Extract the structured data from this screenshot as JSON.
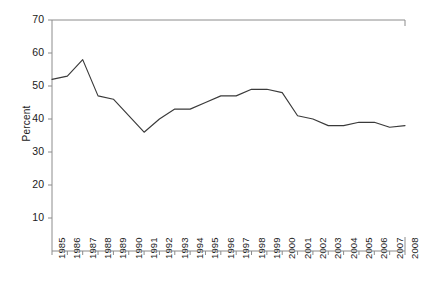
{
  "chart_data": {
    "type": "line",
    "title": "",
    "xlabel": "",
    "ylabel": "Percent",
    "ylim": [
      0,
      70
    ],
    "yticks": [
      0,
      10,
      20,
      30,
      40,
      50,
      60,
      70
    ],
    "ytick_labels": [
      "0",
      "10",
      "20",
      "30",
      "40",
      "50",
      "60",
      "70"
    ],
    "grid": false,
    "legend": "none",
    "categories": [
      "1985",
      "1986",
      "1987",
      "1988",
      "1989",
      "1990",
      "1991",
      "1992",
      "1993",
      "1994",
      "1995",
      "1996",
      "1997",
      "1998",
      "1999",
      "2000",
      "2001",
      "2002",
      "2003",
      "2004",
      "2005",
      "2006",
      "2007",
      "2008"
    ],
    "series": [
      {
        "name": "Percent",
        "values": [
          52,
          53,
          58,
          47,
          46,
          41,
          36,
          40,
          43,
          43,
          45,
          47,
          47,
          49,
          49,
          48,
          41,
          40,
          38,
          38,
          39,
          39,
          37.5,
          38
        ]
      }
    ]
  },
  "axis": {
    "y_title": "Percent"
  }
}
